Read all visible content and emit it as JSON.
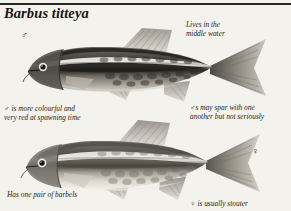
{
  "page": {
    "background_color": "#f4f2ed",
    "ink_color": "#221f19"
  },
  "header": {
    "title": "Barbus titteya",
    "rule_color": "#2a2722"
  },
  "markers": [
    {
      "name": "male-marker",
      "symbol": "♂"
    },
    {
      "name": "female-marker",
      "symbol": "♀"
    }
  ],
  "notes": {
    "lives": "Lives in the\nmiddle water",
    "male_colour": "♂ is more colourful and\nvery red at spawning time",
    "spar": "♂s may spar with one\nanother but not seriously",
    "barbels": "Has one pair of barbels",
    "stouter": "♀ is usually stouter"
  },
  "illustrations": [
    {
      "name": "male-cherry-barb",
      "sex": "♂",
      "description": "Dark lateral stripe with pale band above, dark mottled flanks",
      "body_color": "#8e8a82",
      "stripe_color": "#23211c",
      "highlight_color": "#e8e5de"
    },
    {
      "name": "female-cherry-barb",
      "sex": "♀",
      "description": "Paler stouter body with softer lateral stripe",
      "body_color": "#b5b1a8",
      "stripe_color": "#4a4740",
      "highlight_color": "#efece5"
    }
  ]
}
